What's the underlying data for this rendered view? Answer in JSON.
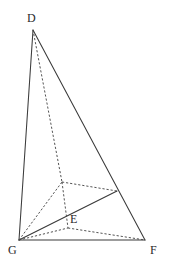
{
  "figure": {
    "background_color": "#ffffff",
    "stroke_color": "#3a3a3a",
    "dashed_stroke_color": "#4a4a4a",
    "label_color": "#2b2b2b",
    "width": 170,
    "height": 276
  },
  "points": {
    "D": {
      "label": "D",
      "x": 33,
      "y": 30,
      "label_x": 27,
      "label_y": 12
    },
    "G": {
      "label": "G",
      "x": 19,
      "y": 240,
      "label_x": 8,
      "label_y": 244
    },
    "F": {
      "label": "F",
      "x": 145,
      "y": 240,
      "label_x": 150,
      "label_y": 244
    },
    "E": {
      "label": "E",
      "x": 68,
      "y": 228,
      "label_x": 70,
      "label_y": 213
    },
    "M": {
      "label": "",
      "x": 62,
      "y": 182,
      "label_x": 0,
      "label_y": 0
    },
    "N": {
      "label": "",
      "x": 117,
      "y": 191,
      "label_x": 0,
      "label_y": 0
    }
  },
  "edges": {
    "solid": [
      {
        "name": "edge-D-G",
        "x1": 33,
        "y1": 30,
        "x2": 19,
        "y2": 240
      },
      {
        "name": "edge-D-F",
        "x1": 33,
        "y1": 30,
        "x2": 145,
        "y2": 240
      },
      {
        "name": "edge-G-F",
        "x1": 19,
        "y1": 240,
        "x2": 145,
        "y2": 240
      },
      {
        "name": "edge-G-N",
        "x1": 19,
        "y1": 240,
        "x2": 117,
        "y2": 191
      }
    ],
    "dashed": [
      {
        "name": "edge-D-M",
        "x1": 33,
        "y1": 30,
        "x2": 62,
        "y2": 182
      },
      {
        "name": "edge-G-M",
        "x1": 19,
        "y1": 240,
        "x2": 62,
        "y2": 182
      },
      {
        "name": "edge-M-N",
        "x1": 62,
        "y1": 182,
        "x2": 117,
        "y2": 191
      },
      {
        "name": "edge-M-E",
        "x1": 62,
        "y1": 182,
        "x2": 68,
        "y2": 228
      },
      {
        "name": "edge-G-E",
        "x1": 19,
        "y1": 240,
        "x2": 68,
        "y2": 228
      },
      {
        "name": "edge-E-F",
        "x1": 68,
        "y1": 228,
        "x2": 145,
        "y2": 240
      }
    ]
  },
  "labels": [
    {
      "key": "D",
      "text": "D",
      "x": 27,
      "y": 12
    },
    {
      "key": "G",
      "text": "G",
      "x": 8,
      "y": 244
    },
    {
      "key": "F",
      "text": "F",
      "x": 150,
      "y": 244
    },
    {
      "key": "E",
      "text": "E",
      "x": 70,
      "y": 213
    }
  ]
}
